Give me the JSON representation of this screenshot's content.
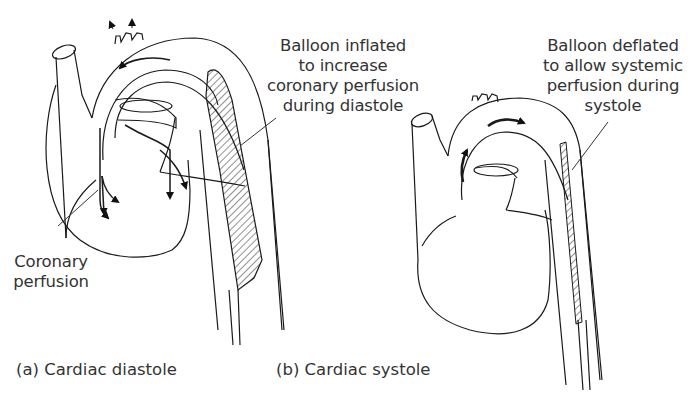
{
  "figure": {
    "panel_a": {
      "caption": "(a) Cardiac diastole",
      "balloon_label": [
        "Balloon inflated",
        "to increase",
        "coronary perfusion",
        "during diastole"
      ],
      "coronary_label": [
        "Coronary",
        "perfusion"
      ]
    },
    "panel_b": {
      "caption": "(b) Cardiac systole",
      "balloon_label": [
        "Balloon deflated",
        "to allow systemic",
        "perfusion during",
        "systole"
      ]
    },
    "colors": {
      "line": "#1a1a1a",
      "text": "#333333",
      "background": "#ffffff"
    }
  }
}
